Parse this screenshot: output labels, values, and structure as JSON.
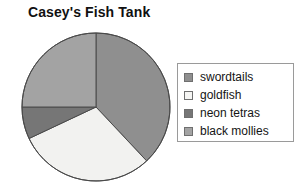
{
  "chart_data": {
    "type": "pie",
    "title": "Casey's Fish Tank",
    "xlabel": "",
    "ylabel": "",
    "legend_position": "right",
    "grid": false,
    "categories": [
      "swordtails",
      "goldfish",
      "neon tetras",
      "black mollies"
    ],
    "values": [
      38,
      30,
      7,
      25
    ],
    "units": "percent",
    "colors": [
      "#8f8f8f",
      "#f2f2f0",
      "#767676",
      "#a3a3a3"
    ],
    "slices": [
      {
        "label": "swordtails",
        "value": 38,
        "color": "#8f8f8f",
        "start_angle": 0,
        "end_angle": 136.8
      },
      {
        "label": "goldfish",
        "value": 30,
        "color": "#f2f2f0",
        "start_angle": 136.8,
        "end_angle": 244.8
      },
      {
        "label": "neon tetras",
        "value": 7,
        "color": "#767676",
        "start_angle": 244.8,
        "end_angle": 270.0
      },
      {
        "label": "black mollies",
        "value": 25,
        "color": "#a3a3a3",
        "start_angle": 270.0,
        "end_angle": 360
      }
    ],
    "stroke_color": "#4a4a4a"
  },
  "legend": {
    "items": [
      {
        "label": "swordtails",
        "color": "#8f8f8f"
      },
      {
        "label": "goldfish",
        "color": "#f5f5f3"
      },
      {
        "label": "neon tetras",
        "color": "#767676"
      },
      {
        "label": "black mollies",
        "color": "#a3a3a3"
      }
    ]
  }
}
